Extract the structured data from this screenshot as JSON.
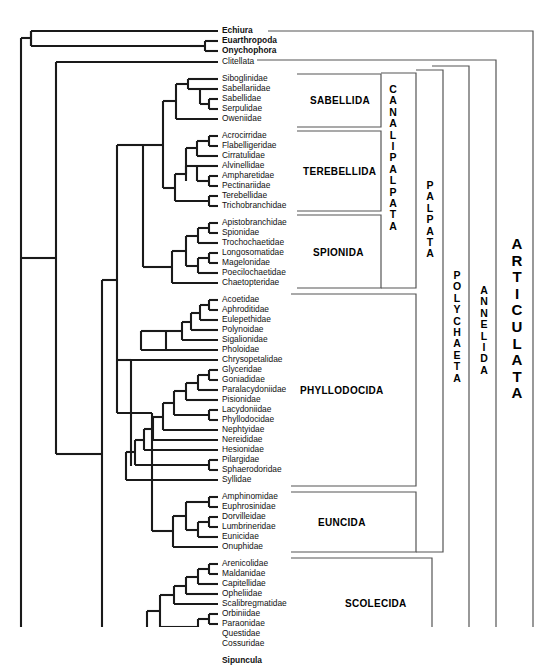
{
  "figure": {
    "type": "cladogram",
    "line_color": "#1a1a1a",
    "bracket_color": "#555555",
    "background": "#ffffff"
  },
  "leaves": [
    {
      "name": "Echiura",
      "bold": true,
      "y": 31
    },
    {
      "name": "Euarthropoda",
      "bold": true,
      "y": 41
    },
    {
      "name": "Onychophora",
      "bold": true,
      "y": 51
    },
    {
      "name": "Clitellata",
      "bold": false,
      "y": 62
    },
    {
      "name": "Siboglinidae",
      "bold": false,
      "y": 79
    },
    {
      "name": "Sabellariidae",
      "bold": false,
      "y": 89
    },
    {
      "name": "Sabellidae",
      "bold": false,
      "y": 99
    },
    {
      "name": "Serpulidae",
      "bold": false,
      "y": 109
    },
    {
      "name": "Oweniidae",
      "bold": false,
      "y": 119
    },
    {
      "name": "Acrocirridae",
      "bold": false,
      "y": 136
    },
    {
      "name": "Flabelligeridae",
      "bold": false,
      "y": 146
    },
    {
      "name": "Cirratulidae",
      "bold": false,
      "y": 156
    },
    {
      "name": "Alvinellidae",
      "bold": false,
      "y": 166
    },
    {
      "name": "Ampharetidae",
      "bold": false,
      "y": 176
    },
    {
      "name": "Pectinariidae",
      "bold": false,
      "y": 186
    },
    {
      "name": "Terebellidae",
      "bold": false,
      "y": 196
    },
    {
      "name": "Trichobranchidae",
      "bold": false,
      "y": 206
    },
    {
      "name": "Apistobranchidae",
      "bold": false,
      "y": 223
    },
    {
      "name": "Spionidae",
      "bold": false,
      "y": 233
    },
    {
      "name": "Trochochaetidae",
      "bold": false,
      "y": 243
    },
    {
      "name": "Longosomatidae",
      "bold": false,
      "y": 253
    },
    {
      "name": "Magelonidae",
      "bold": false,
      "y": 263
    },
    {
      "name": "Poecilochaetidae",
      "bold": false,
      "y": 273
    },
    {
      "name": "Chaetopteridae",
      "bold": false,
      "y": 283
    },
    {
      "name": "Acoetidae",
      "bold": false,
      "y": 300
    },
    {
      "name": "Aphroditidae",
      "bold": false,
      "y": 310
    },
    {
      "name": "Eulepethidae",
      "bold": false,
      "y": 320
    },
    {
      "name": "Polynoidae",
      "bold": false,
      "y": 330
    },
    {
      "name": "Sigalionidae",
      "bold": false,
      "y": 340
    },
    {
      "name": "Pholoidae",
      "bold": false,
      "y": 350
    },
    {
      "name": "Chrysopetalidae",
      "bold": false,
      "y": 360
    },
    {
      "name": "Glyceridae",
      "bold": false,
      "y": 370
    },
    {
      "name": "Goniadidae",
      "bold": false,
      "y": 380
    },
    {
      "name": "Paralacydoniidae",
      "bold": false,
      "y": 390
    },
    {
      "name": "Pisionidae",
      "bold": false,
      "y": 400
    },
    {
      "name": "Lacydoniidae",
      "bold": false,
      "y": 410
    },
    {
      "name": "Phyllodocidae",
      "bold": false,
      "y": 420
    },
    {
      "name": "Nephtyidae",
      "bold": false,
      "y": 430
    },
    {
      "name": "Nereididae",
      "bold": false,
      "y": 440
    },
    {
      "name": "Hesionidae",
      "bold": false,
      "y": 450
    },
    {
      "name": "Pilargidae",
      "bold": false,
      "y": 460
    },
    {
      "name": "Sphaerodoridae",
      "bold": false,
      "y": 470
    },
    {
      "name": "Syllidae",
      "bold": false,
      "y": 480
    },
    {
      "name": "Amphinomidae",
      "bold": false,
      "y": 497
    },
    {
      "name": "Euphrosinidae",
      "bold": false,
      "y": 507
    },
    {
      "name": "Dorvilleidae",
      "bold": false,
      "y": 517
    },
    {
      "name": "Lumbrineridae",
      "bold": false,
      "y": 527
    },
    {
      "name": "Eunicidae",
      "bold": false,
      "y": 537
    },
    {
      "name": "Onuphidae",
      "bold": false,
      "y": 547
    },
    {
      "name": "Arenicolidae",
      "bold": false,
      "y": 564
    },
    {
      "name": "Maldanidae",
      "bold": false,
      "y": 574
    },
    {
      "name": "Capitellidae",
      "bold": false,
      "y": 584
    },
    {
      "name": "Opheliidae",
      "bold": false,
      "y": 594
    },
    {
      "name": "Scalibregmatidae",
      "bold": false,
      "y": 604
    },
    {
      "name": "Orbiniidae",
      "bold": false,
      "y": 614
    },
    {
      "name": "Paraonidae",
      "bold": false,
      "y": 624
    },
    {
      "name": "Questidae",
      "bold": false,
      "y": 634
    },
    {
      "name": "Cossuridae",
      "bold": false,
      "y": 644
    },
    {
      "name": "Sipuncula",
      "bold": true,
      "y": 661
    }
  ],
  "order_labels": [
    {
      "name": "SABELLIDA",
      "x": 310,
      "y": 100
    },
    {
      "name": "TEREBELLIDA",
      "x": 305,
      "y": 171
    },
    {
      "name": "SPIONIDA",
      "x": 313,
      "y": 253
    },
    {
      "name": "PHYLLODOCIDA",
      "x": 302,
      "y": 390
    },
    {
      "name": "EUNCIDA",
      "x": 316,
      "y": 522
    },
    {
      "name": "SCOLECIDA",
      "x": 345,
      "y": 604
    }
  ],
  "clade_brackets": [
    {
      "name": "CANALIPALPATA",
      "letters": "CANALIPALPATA",
      "x": 385,
      "y_center": 190,
      "size": "normal"
    },
    {
      "name": "PALPATA",
      "letters": "PALPATA",
      "x": 421,
      "y_center": 265,
      "size": "normal"
    },
    {
      "name": "POLYCHAETA",
      "letters": "POLYCHAETA",
      "x": 447,
      "y_center": 330,
      "size": "normal"
    },
    {
      "name": "ANNELIDA",
      "letters": "ANNELIDA",
      "x": 474,
      "y_center": 330,
      "size": "normal"
    },
    {
      "name": "ARTICULATA",
      "letters": "ARTICULATA",
      "x": 510,
      "y_center": 320,
      "size": "big"
    }
  ],
  "root_note": ""
}
